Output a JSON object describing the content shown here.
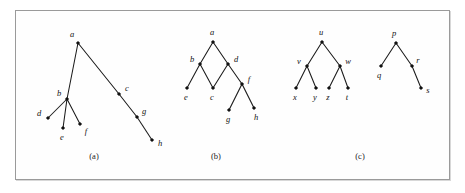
{
  "figure": {
    "background_color": "#ffffff",
    "panel_background_color": "#fefefe",
    "border_color": "#9a9a9a",
    "ink_color": "#111111",
    "frame": {
      "x": 15,
      "y": 10,
      "width": 435,
      "height": 170
    }
  },
  "chart_data": {
    "type": "diagram",
    "title": "",
    "subtitle": "",
    "xlabel": "",
    "ylabel": "",
    "grid": false,
    "legend_position": "none",
    "panels": [
      {
        "id": "a",
        "caption": "(a)",
        "caption_pos": {
          "x": 94,
          "y": 156
        },
        "nodes": [
          {
            "id": "a",
            "label": "a",
            "x": 78,
            "y": 43,
            "label_x": 72,
            "label_y": 34
          },
          {
            "id": "b",
            "label": "b",
            "x": 67,
            "y": 99,
            "label_x": 59,
            "label_y": 93
          },
          {
            "id": "c",
            "label": "c",
            "x": 119,
            "y": 94,
            "label_x": 127,
            "label_y": 88
          },
          {
            "id": "d",
            "label": "d",
            "x": 48,
            "y": 118,
            "label_x": 39,
            "label_y": 113
          },
          {
            "id": "e",
            "label": "e",
            "x": 63,
            "y": 128,
            "label_x": 62,
            "label_y": 137
          },
          {
            "id": "f",
            "label": "f",
            "x": 80,
            "y": 124,
            "label_x": 86,
            "label_y": 131
          },
          {
            "id": "g",
            "label": "g",
            "x": 137,
            "y": 117,
            "label_x": 144,
            "label_y": 111
          },
          {
            "id": "h",
            "label": "h",
            "x": 152,
            "y": 140,
            "label_x": 160,
            "label_y": 143
          }
        ],
        "edges": [
          [
            "a",
            "b"
          ],
          [
            "a",
            "c"
          ],
          [
            "b",
            "d"
          ],
          [
            "b",
            "e"
          ],
          [
            "b",
            "f"
          ],
          [
            "c",
            "g"
          ],
          [
            "g",
            "h"
          ]
        ]
      },
      {
        "id": "b",
        "caption": "(b)",
        "caption_pos": {
          "x": 216,
          "y": 156
        },
        "nodes": [
          {
            "id": "a",
            "label": "a",
            "x": 213,
            "y": 42,
            "label_x": 212,
            "label_y": 32
          },
          {
            "id": "b",
            "label": "b",
            "x": 200,
            "y": 64,
            "label_x": 192,
            "label_y": 59
          },
          {
            "id": "d",
            "label": "d",
            "x": 228,
            "y": 64,
            "label_x": 236,
            "label_y": 59
          },
          {
            "id": "e",
            "label": "e",
            "x": 187,
            "y": 88,
            "label_x": 186,
            "label_y": 97
          },
          {
            "id": "c",
            "label": "c",
            "x": 213,
            "y": 88,
            "label_x": 212,
            "label_y": 97
          },
          {
            "id": "f",
            "label": "f",
            "x": 242,
            "y": 84,
            "label_x": 249,
            "label_y": 79
          },
          {
            "id": "g",
            "label": "g",
            "x": 229,
            "y": 110,
            "label_x": 228,
            "label_y": 119
          },
          {
            "id": "h",
            "label": "h",
            "x": 254,
            "y": 108,
            "label_x": 256,
            "label_y": 117
          }
        ],
        "edges": [
          [
            "a",
            "b"
          ],
          [
            "a",
            "d"
          ],
          [
            "b",
            "e"
          ],
          [
            "b",
            "c"
          ],
          [
            "d",
            "c"
          ],
          [
            "d",
            "f"
          ],
          [
            "f",
            "g"
          ],
          [
            "f",
            "h"
          ]
        ]
      },
      {
        "id": "c",
        "caption": "(c)",
        "caption_pos": {
          "x": 360,
          "y": 156
        },
        "nodes": [
          {
            "id": "u",
            "label": "u",
            "x": 322,
            "y": 42,
            "label_x": 321,
            "label_y": 32
          },
          {
            "id": "v",
            "label": "v",
            "x": 307,
            "y": 66,
            "label_x": 299,
            "label_y": 61
          },
          {
            "id": "w",
            "label": "w",
            "x": 340,
            "y": 66,
            "label_x": 348,
            "label_y": 61
          },
          {
            "id": "x",
            "label": "x",
            "x": 296,
            "y": 88,
            "label_x": 295,
            "label_y": 97
          },
          {
            "id": "y",
            "label": "y",
            "x": 316,
            "y": 88,
            "label_x": 315,
            "label_y": 97
          },
          {
            "id": "z",
            "label": "z",
            "x": 329,
            "y": 88,
            "label_x": 328,
            "label_y": 97
          },
          {
            "id": "t",
            "label": "t",
            "x": 348,
            "y": 88,
            "label_x": 347,
            "label_y": 97
          },
          {
            "id": "p",
            "label": "p",
            "x": 396,
            "y": 43,
            "label_x": 394,
            "label_y": 33
          },
          {
            "id": "q",
            "label": "q",
            "x": 381,
            "y": 66,
            "label_x": 379,
            "label_y": 75
          },
          {
            "id": "r",
            "label": "r",
            "x": 412,
            "y": 66,
            "label_x": 418,
            "label_y": 60
          },
          {
            "id": "s",
            "label": "s",
            "x": 421,
            "y": 88,
            "label_x": 428,
            "label_y": 90
          }
        ],
        "edges": [
          [
            "u",
            "v"
          ],
          [
            "u",
            "w"
          ],
          [
            "v",
            "x"
          ],
          [
            "v",
            "y"
          ],
          [
            "w",
            "z"
          ],
          [
            "w",
            "t"
          ],
          [
            "p",
            "q"
          ],
          [
            "p",
            "r"
          ],
          [
            "r",
            "s"
          ]
        ]
      }
    ]
  }
}
